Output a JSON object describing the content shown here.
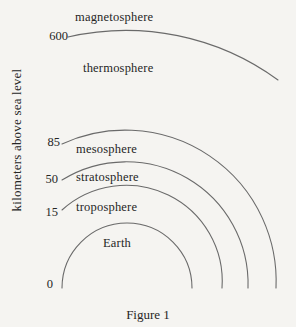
{
  "diagram": {
    "type": "atmospheric-layers-figure",
    "caption": "Figure 1",
    "axis": {
      "label": "kilometers above sea level",
      "ticks": [
        "600",
        "85",
        "50",
        "15",
        "0"
      ]
    },
    "layers": [
      {
        "label": "magnetosphere",
        "boundary_tick_km": "600"
      },
      {
        "label": "thermosphere",
        "boundary_tick_km": "85"
      },
      {
        "label": "mesosphere",
        "boundary_tick_km": "50"
      },
      {
        "label": "stratosphere",
        "boundary_tick_km": "15"
      },
      {
        "label": "troposphere",
        "boundary_tick_km": "0"
      },
      {
        "label": "Earth",
        "boundary_tick_km": "0"
      }
    ],
    "colors": {
      "background": "#f5f4f1",
      "line": "#6a6a6a",
      "text": "#262626"
    }
  }
}
